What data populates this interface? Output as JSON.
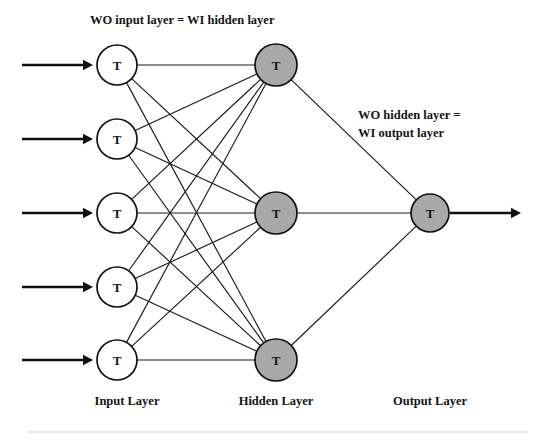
{
  "diagram": {
    "type": "neural-network",
    "title_top": "WO input layer  = WI hidden layer",
    "title_right_line1": "WO hidden layer =",
    "title_right_line2": "WI output layer",
    "node_symbol": "T",
    "colors": {
      "input_node_fill": "#ffffff",
      "hidden_node_fill": "#a9a9a9",
      "output_node_fill": "#a9a9a9",
      "node_stroke": "#111111",
      "edge": "#1a1a1a",
      "text": "#141414",
      "background": "#ffffff",
      "bottom_rule": "#c9c9c9"
    },
    "layers": [
      {
        "id": "input",
        "caption": "Input Layer",
        "caption_x": 127,
        "caption_y": 405,
        "node_count": 5,
        "node_fill": "#ffffff",
        "radius": 20,
        "cx": 117,
        "node_cys": [
          65,
          139,
          213,
          287,
          360
        ]
      },
      {
        "id": "hidden",
        "caption": "Hidden Layer",
        "caption_x": 276,
        "caption_y": 405,
        "node_count": 3,
        "node_fill": "#a9a9a9",
        "radius": 21,
        "cx": 276,
        "node_cys": [
          65,
          213,
          360
        ]
      },
      {
        "id": "output",
        "caption": "Output Layer",
        "caption_x": 430,
        "caption_y": 405,
        "node_count": 1,
        "node_fill": "#a9a9a9",
        "radius": 19,
        "cx": 430,
        "node_cys": [
          213
        ]
      }
    ],
    "input_arrows": [
      {
        "x1": 22,
        "x2": 93,
        "y": 65
      },
      {
        "x1": 22,
        "x2": 93,
        "y": 139
      },
      {
        "x1": 22,
        "x2": 93,
        "y": 213
      },
      {
        "x1": 22,
        "x2": 93,
        "y": 287
      },
      {
        "x1": 22,
        "x2": 93,
        "y": 360
      }
    ],
    "output_arrow": {
      "x1": 450,
      "x2": 521,
      "y": 213
    },
    "connections": {
      "input_to_hidden": "fully-connected",
      "hidden_to_output": "fully-connected"
    },
    "top_label_x": 90,
    "top_label_y": 24,
    "right_label_x": 358,
    "right_label_y1": 119,
    "right_label_y2": 137,
    "bottom_rule_y": 432
  }
}
